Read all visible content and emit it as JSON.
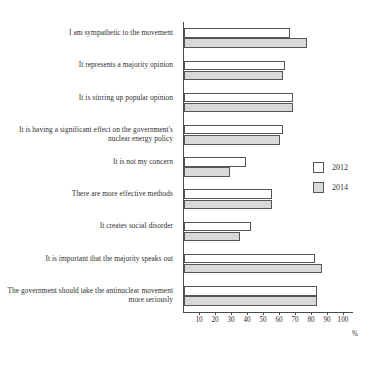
{
  "chart_data": {
    "type": "bar",
    "orientation": "horizontal",
    "title": "",
    "xlabel": "%",
    "ylabel": "",
    "xlim": [
      0,
      100
    ],
    "grid": false,
    "legend_position": "center-right",
    "categories": [
      "I am sympathetic to the movement",
      "It represents a majority opinion",
      "It is stirring up popular opinion",
      "It is having a significant effect on the government's nuclear energy policy",
      "It is not my concern",
      "There are more effective methods",
      "It creates social disorder",
      "It is important that the majority speaks out",
      "The government should take the antinuclear movement more seriously"
    ],
    "series": [
      {
        "name": "2012",
        "color": "#ffffff",
        "values": [
          66,
          63,
          68,
          62,
          39,
          55,
          42,
          82,
          83
        ]
      },
      {
        "name": "2014",
        "color": "#d9d9d9",
        "values": [
          77,
          62,
          68,
          60,
          29,
          55,
          35,
          86,
          83
        ]
      }
    ],
    "ticks": [
      10,
      20,
      30,
      40,
      50,
      60,
      70,
      80,
      90,
      100
    ]
  },
  "legend": {
    "entries": [
      {
        "label": "2012"
      },
      {
        "label": "2014"
      }
    ]
  },
  "axis": {
    "unit": "%"
  }
}
